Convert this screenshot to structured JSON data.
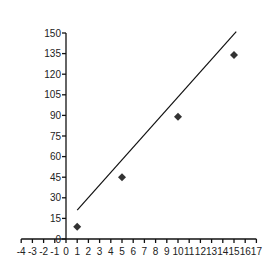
{
  "chart_data": {
    "type": "scatter",
    "title": "",
    "xlabel": "",
    "ylabel": "",
    "xlim": [
      -4,
      17
    ],
    "ylim": [
      0,
      150
    ],
    "x_ticks": [
      -4,
      -3,
      -2,
      -1,
      0,
      1,
      2,
      3,
      4,
      5,
      6,
      7,
      8,
      9,
      10,
      11,
      12,
      13,
      14,
      15,
      16,
      17
    ],
    "y_ticks": [
      0,
      15,
      30,
      45,
      60,
      75,
      90,
      105,
      120,
      135,
      150
    ],
    "grid": false,
    "legend": null,
    "series": [
      {
        "name": "data",
        "marker": "diamond",
        "color": "#333333",
        "points": [
          {
            "x": 1,
            "y": 9
          },
          {
            "x": 5,
            "y": 45
          },
          {
            "x": 10,
            "y": 89
          },
          {
            "x": 15,
            "y": 134
          }
        ]
      }
    ],
    "trendline": {
      "type": "linear",
      "color": "#111111",
      "start": {
        "x": 1,
        "y": 21
      },
      "end": {
        "x": 15.2,
        "y": 151
      }
    }
  }
}
